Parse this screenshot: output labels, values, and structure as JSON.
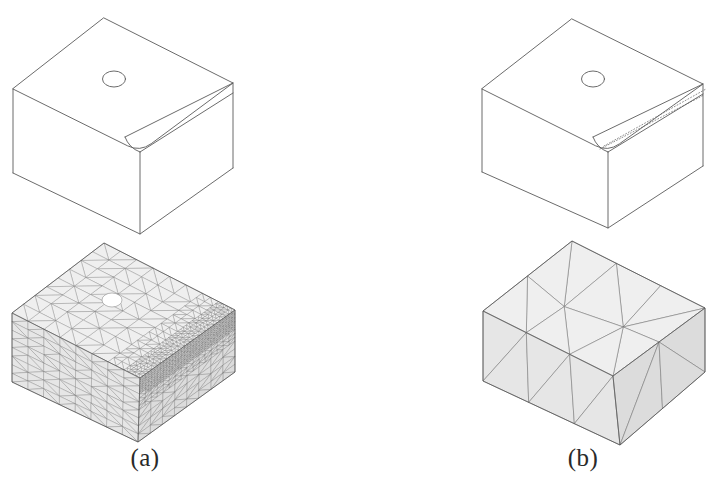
{
  "figure": {
    "type": "technical-illustration",
    "background_color": "#ffffff",
    "line_color": "#5a5a5a",
    "mesh_line_color": "#6b6b6b",
    "mesh_fill_color": "#e9e9e9",
    "caption_color": "#2a2a2a"
  },
  "panels": [
    {
      "id": "a",
      "caption": "(a)",
      "caption_center_x": 145,
      "caption_y": 463,
      "solid": {
        "name": "chamfered-block-solid-a",
        "hole": {
          "cx": 114,
          "cy": 79,
          "rx": 11.5,
          "ry": 8
        },
        "top_face": [
          [
            104,
            18
          ],
          [
            233,
            83
          ],
          [
            140,
            152
          ],
          [
            13,
            89
          ]
        ],
        "left_face": [
          [
            13,
            89
          ],
          [
            140,
            152
          ],
          [
            140,
            234
          ],
          [
            13,
            173
          ]
        ],
        "right_face": [
          [
            140,
            152
          ],
          [
            233,
            83
          ],
          [
            233,
            168
          ],
          [
            140,
            234
          ]
        ],
        "chamfer_upper": [
          [
            125,
            137
          ],
          [
            233,
            83
          ]
        ],
        "chamfer_lower": [
          [
            140,
            152
          ],
          [
            233,
            93
          ]
        ],
        "fillet_radius": 14,
        "hidden_lines": []
      },
      "mesh": {
        "name": "fine-tetrahedral-mesh-a",
        "density": "fine",
        "refined_zone": "chamfer-edge",
        "top_face": [
          [
            104,
            243
          ],
          [
            235,
            310
          ],
          [
            140,
            378
          ],
          [
            12,
            313
          ]
        ],
        "left_face": [
          [
            12,
            313
          ],
          [
            140,
            378
          ],
          [
            138,
            442
          ],
          [
            12,
            382
          ]
        ],
        "right_face": [
          [
            140,
            378
          ],
          [
            235,
            310
          ],
          [
            235,
            372
          ],
          [
            138,
            442
          ]
        ],
        "hole": {
          "cx": 112,
          "cy": 300,
          "rx": 10,
          "ry": 7
        },
        "seed": 1337,
        "coarse_cell": 17,
        "fine_cell": 4.6,
        "band_halfwidth": 13
      }
    },
    {
      "id": "b",
      "caption": "(b)",
      "caption_center_x": 583,
      "caption_y": 463,
      "solid": {
        "name": "chamfered-block-solid-b",
        "hole": {
          "cx": 593,
          "cy": 79,
          "rx": 11.5,
          "ry": 8
        },
        "top_face": [
          [
            572,
            19
          ],
          [
            703,
            84
          ],
          [
            608,
            152
          ],
          [
            482,
            89
          ]
        ],
        "left_face": [
          [
            482,
            89
          ],
          [
            608,
            152
          ],
          [
            608,
            228
          ],
          [
            482,
            172
          ]
        ],
        "right_face": [
          [
            608,
            152
          ],
          [
            703,
            84
          ],
          [
            703,
            166
          ],
          [
            608,
            228
          ]
        ],
        "chamfer_upper": [
          [
            593,
            137
          ],
          [
            703,
            84
          ]
        ],
        "chamfer_lower": [
          [
            608,
            152
          ],
          [
            703,
            94
          ]
        ],
        "fillet_radius": 14,
        "hidden_lines": [
          [
            [
              600,
              149
            ],
            [
              704,
              95
            ]
          ],
          [
            [
              604,
              146
            ],
            [
              706,
              89
            ]
          ]
        ]
      },
      "mesh": {
        "name": "coarse-tetrahedral-mesh-b",
        "density": "coarse",
        "refined_zone": "none",
        "top_face": [
          [
            572,
            241
          ],
          [
            705,
            308
          ],
          [
            613,
            376
          ],
          [
            483,
            311
          ]
        ],
        "left_face": [
          [
            483,
            311
          ],
          [
            613,
            376
          ],
          [
            620,
            445
          ],
          [
            483,
            381
          ]
        ],
        "right_face": [
          [
            613,
            376
          ],
          [
            705,
            308
          ],
          [
            705,
            372
          ],
          [
            620,
            445
          ]
        ],
        "seed": 4242,
        "coarse_cell": 52
      }
    }
  ],
  "captions": {
    "a": "(a)",
    "b": "(b)"
  }
}
